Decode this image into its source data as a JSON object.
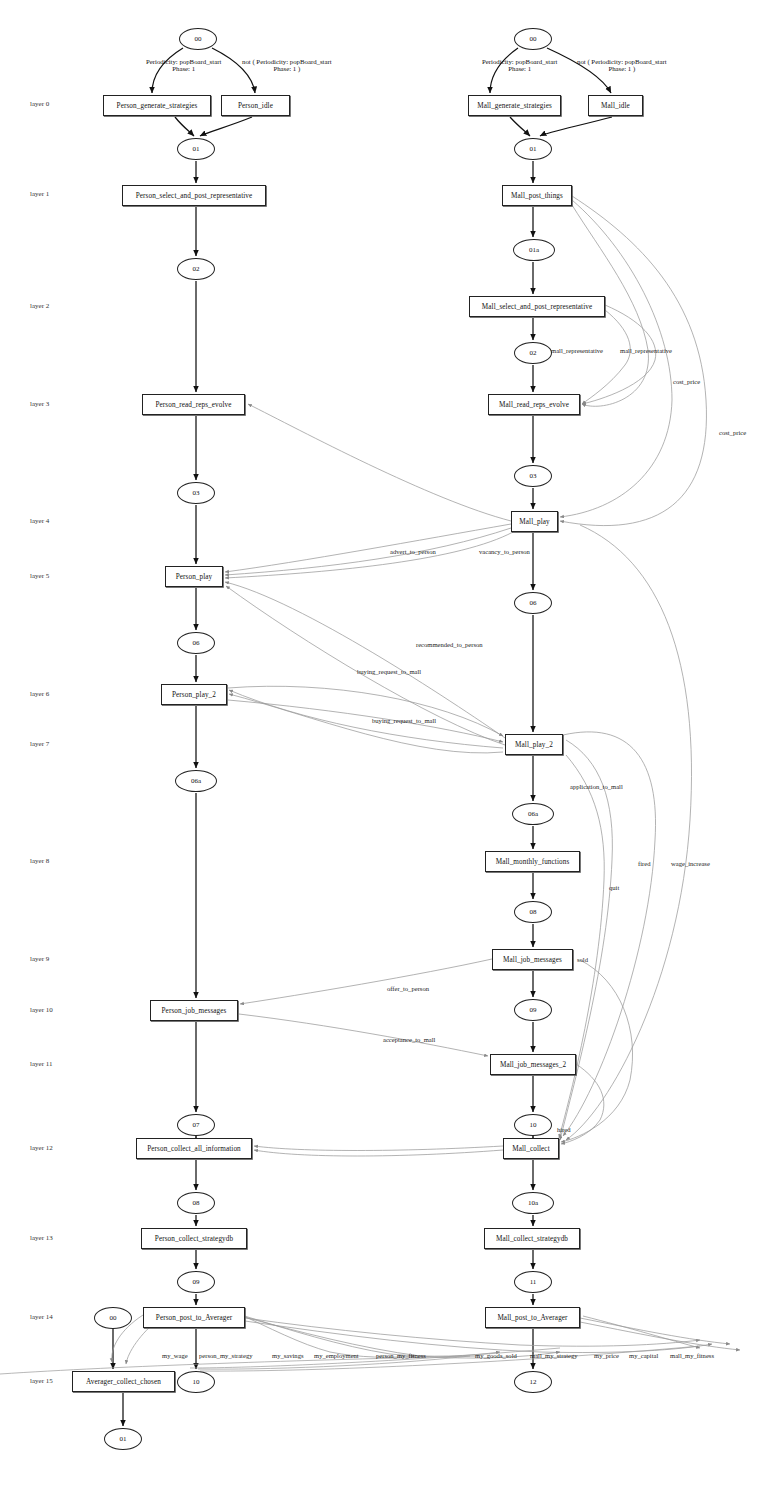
{
  "diagram": {
    "layers": [
      {
        "label": "layer 0",
        "y": 104
      },
      {
        "label": "layer 1",
        "y": 194
      },
      {
        "label": "layer 2",
        "y": 306
      },
      {
        "label": "layer 3",
        "y": 404
      },
      {
        "label": "layer 4",
        "y": 521
      },
      {
        "label": "layer 5",
        "y": 576
      },
      {
        "label": "layer 6",
        "y": 694
      },
      {
        "label": "layer 7",
        "y": 744
      },
      {
        "label": "layer 8",
        "y": 861
      },
      {
        "label": "layer 9",
        "y": 959
      },
      {
        "label": "layer 10",
        "y": 1010
      },
      {
        "label": "layer 11",
        "y": 1064
      },
      {
        "label": "layer 12",
        "y": 1148
      },
      {
        "label": "layer 13",
        "y": 1238
      },
      {
        "label": "layer 14",
        "y": 1317
      },
      {
        "label": "layer 15",
        "y": 1381
      }
    ],
    "boxes": [
      {
        "id": "person_generate_strategies",
        "label": "Person_generate_strategies",
        "x": 103,
        "y": 95,
        "w": 108,
        "h": 21
      },
      {
        "id": "person_idle",
        "label": "Person_idle",
        "x": 221,
        "y": 95,
        "w": 69,
        "h": 21
      },
      {
        "id": "person_select_and_post_representative",
        "label": "Person_select_and_post_representative",
        "x": 122,
        "y": 185,
        "w": 144,
        "h": 21
      },
      {
        "id": "person_read_reps_evolve",
        "label": "Person_read_reps_evolve",
        "x": 142,
        "y": 394,
        "w": 103,
        "h": 21
      },
      {
        "id": "person_play",
        "label": "Person_play",
        "x": 165,
        "y": 566,
        "w": 58,
        "h": 21
      },
      {
        "id": "person_play_2",
        "label": "Person_play_2",
        "x": 161,
        "y": 684,
        "w": 66,
        "h": 21
      },
      {
        "id": "person_job_messages",
        "label": "Person_job_messages",
        "x": 150,
        "y": 1000,
        "w": 88,
        "h": 21
      },
      {
        "id": "person_collect_all_information",
        "label": "Person_collect_all_information",
        "x": 136,
        "y": 1138,
        "w": 116,
        "h": 21
      },
      {
        "id": "person_collect_strategydb",
        "label": "Person_collect_strategydb",
        "x": 141,
        "y": 1228,
        "w": 106,
        "h": 21
      },
      {
        "id": "person_post_to_averager",
        "label": "Person_post_to_Averager",
        "x": 143,
        "y": 1307,
        "w": 102,
        "h": 21
      },
      {
        "id": "averager_collect_chosen",
        "label": "Averager_collect_chosen",
        "x": 72,
        "y": 1371,
        "w": 103,
        "h": 21
      },
      {
        "id": "mall_generate_strategies",
        "label": "Mall_generate_strategies",
        "x": 468,
        "y": 95,
        "w": 93,
        "h": 21
      },
      {
        "id": "mall_idle",
        "label": "Mall_idle",
        "x": 588,
        "y": 95,
        "w": 55,
        "h": 21
      },
      {
        "id": "mall_post_things",
        "label": "Mall_post_things",
        "x": 502,
        "y": 185,
        "w": 70,
        "h": 21
      },
      {
        "id": "mall_select_and_post_representative",
        "label": "Mall_select_and_post_representative",
        "x": 469,
        "y": 296,
        "w": 136,
        "h": 21
      },
      {
        "id": "mall_read_reps_evolve",
        "label": "Mall_read_reps_evolve",
        "x": 488,
        "y": 394,
        "w": 92,
        "h": 21
      },
      {
        "id": "mall_play",
        "label": "Mall_play",
        "x": 511,
        "y": 511,
        "w": 47,
        "h": 21
      },
      {
        "id": "mall_play_2",
        "label": "Mall_play_2",
        "x": 505,
        "y": 734,
        "w": 58,
        "h": 21
      },
      {
        "id": "mall_monthly_functions",
        "label": "Mall_monthly_functions",
        "x": 485,
        "y": 851,
        "w": 95,
        "h": 21
      },
      {
        "id": "mall_job_messages",
        "label": "Mall_job_messages",
        "x": 492,
        "y": 949,
        "w": 81,
        "h": 21
      },
      {
        "id": "mall_job_messages_2",
        "label": "Mall_job_messages_2",
        "x": 490,
        "y": 1054,
        "w": 86,
        "h": 21
      },
      {
        "id": "mall_collect",
        "label": "Mall_collect",
        "x": 503,
        "y": 1138,
        "w": 56,
        "h": 21
      },
      {
        "id": "mall_collect_strategydb",
        "label": "Mall_collect_strategydb",
        "x": 484,
        "y": 1228,
        "w": 96,
        "h": 21
      },
      {
        "id": "mall_post_to_averager",
        "label": "Mall_post_to_Averager",
        "x": 485,
        "y": 1307,
        "w": 95,
        "h": 21
      }
    ],
    "ellipses": [
      {
        "id": "p00",
        "label": "00",
        "x": 179,
        "y": 28,
        "w": 38,
        "h": 22
      },
      {
        "id": "p01",
        "label": "01",
        "x": 177,
        "y": 138,
        "w": 38,
        "h": 22
      },
      {
        "id": "p02",
        "label": "02",
        "x": 177,
        "y": 258,
        "w": 38,
        "h": 22
      },
      {
        "id": "p03",
        "label": "03",
        "x": 177,
        "y": 482,
        "w": 38,
        "h": 22
      },
      {
        "id": "p06",
        "label": "06",
        "x": 177,
        "y": 632,
        "w": 38,
        "h": 22
      },
      {
        "id": "p06a",
        "label": "06a",
        "x": 175,
        "y": 770,
        "w": 42,
        "h": 22
      },
      {
        "id": "p07",
        "label": "07",
        "x": 177,
        "y": 1114,
        "w": 38,
        "h": 22
      },
      {
        "id": "p08",
        "label": "08",
        "x": 177,
        "y": 1192,
        "w": 38,
        "h": 22
      },
      {
        "id": "p09",
        "label": "09",
        "x": 177,
        "y": 1271,
        "w": 38,
        "h": 22
      },
      {
        "id": "av00",
        "label": "00",
        "x": 94,
        "y": 1307,
        "w": 38,
        "h": 22
      },
      {
        "id": "p10",
        "label": "10",
        "x": 177,
        "y": 1371,
        "w": 38,
        "h": 22
      },
      {
        "id": "av01",
        "label": "01",
        "x": 104,
        "y": 1428,
        "w": 38,
        "h": 22
      },
      {
        "id": "m00",
        "label": "00",
        "x": 514,
        "y": 28,
        "w": 38,
        "h": 22
      },
      {
        "id": "m01",
        "label": "01",
        "x": 514,
        "y": 138,
        "w": 38,
        "h": 22
      },
      {
        "id": "m01a",
        "label": "01a",
        "x": 513,
        "y": 239,
        "w": 42,
        "h": 22
      },
      {
        "id": "m02",
        "label": "02",
        "x": 514,
        "y": 342,
        "w": 38,
        "h": 22
      },
      {
        "id": "m03",
        "label": "03",
        "x": 514,
        "y": 465,
        "w": 38,
        "h": 22
      },
      {
        "id": "m06",
        "label": "06",
        "x": 514,
        "y": 592,
        "w": 38,
        "h": 22
      },
      {
        "id": "m06a",
        "label": "06a",
        "x": 512,
        "y": 803,
        "w": 42,
        "h": 22
      },
      {
        "id": "m08",
        "label": "08",
        "x": 514,
        "y": 901,
        "w": 38,
        "h": 22
      },
      {
        "id": "m09",
        "label": "09",
        "x": 514,
        "y": 999,
        "w": 38,
        "h": 22
      },
      {
        "id": "m10",
        "label": "10",
        "x": 514,
        "y": 1114,
        "w": 38,
        "h": 22
      },
      {
        "id": "m10a",
        "label": "10a",
        "x": 512,
        "y": 1192,
        "w": 42,
        "h": 22
      },
      {
        "id": "m11",
        "label": "11",
        "x": 514,
        "y": 1271,
        "w": 38,
        "h": 22
      },
      {
        "id": "m12",
        "label": "12",
        "x": 514,
        "y": 1371,
        "w": 38,
        "h": 22
      }
    ],
    "conditions": [
      {
        "id": "person_cond_left",
        "line1": "Periodicity: popBoard_start",
        "line2": "Phase: 1",
        "x": 146,
        "y": 58
      },
      {
        "id": "person_cond_right",
        "line1": "not ( Periodicity: popBoard_start",
        "line2": "Phase: 1 )",
        "x": 242,
        "y": 58
      },
      {
        "id": "mall_cond_left",
        "line1": "Periodicity: popBoard_start",
        "line2": "Phase: 1",
        "x": 482,
        "y": 58
      },
      {
        "id": "mall_cond_right",
        "line1": "not ( Periodicity: popBoard_start",
        "line2": "Phase: 1 )",
        "x": 577,
        "y": 58
      }
    ],
    "edge_labels": [
      {
        "id": "mall_representative_1",
        "text": "mall_representative",
        "x": 551,
        "y": 347
      },
      {
        "id": "mall_representative_2",
        "text": "mall_representative",
        "x": 620,
        "y": 347
      },
      {
        "id": "cost_price_1",
        "text": "cost_price",
        "x": 673,
        "y": 378
      },
      {
        "id": "cost_price_2",
        "text": "cost_price",
        "x": 719,
        "y": 429
      },
      {
        "id": "advert_to_person",
        "text": "advert_to_person",
        "x": 390,
        "y": 548
      },
      {
        "id": "vacancy_to_person",
        "text": "vacancy_to_person",
        "x": 479,
        "y": 548
      },
      {
        "id": "recommended_to_person",
        "text": "recommended_to_person",
        "x": 416,
        "y": 641
      },
      {
        "id": "buying_request_to_mall_1",
        "text": "buying_request_to_mall",
        "x": 357,
        "y": 668
      },
      {
        "id": "buying_request_to_mall_2",
        "text": "buying_request_to_mall",
        "x": 372,
        "y": 717
      },
      {
        "id": "application_to_mall",
        "text": "application_to_mall",
        "x": 570,
        "y": 783
      },
      {
        "id": "quit",
        "text": "quit",
        "x": 609,
        "y": 884
      },
      {
        "id": "fired_1",
        "text": "fired",
        "x": 638,
        "y": 860
      },
      {
        "id": "wage_increase",
        "text": "wage_increase",
        "x": 671,
        "y": 860
      },
      {
        "id": "sold",
        "text": "sold",
        "x": 577,
        "y": 956
      },
      {
        "id": "offer_to_person",
        "text": "offer_to_person",
        "x": 387,
        "y": 985
      },
      {
        "id": "acceptance_to_mall",
        "text": "acceptance_to_mall",
        "x": 383,
        "y": 1036
      },
      {
        "id": "hired",
        "text": "hired",
        "x": 557,
        "y": 1126
      },
      {
        "id": "my_wage",
        "text": "my_wage",
        "x": 162,
        "y": 1352
      },
      {
        "id": "person_my_strategy",
        "text": "person_my_strategy",
        "x": 199,
        "y": 1352
      },
      {
        "id": "my_savings",
        "text": "my_savings",
        "x": 272,
        "y": 1352
      },
      {
        "id": "my_employment",
        "text": "my_employment",
        "x": 314,
        "y": 1352
      },
      {
        "id": "person_my_fitness",
        "text": "person_my_fitness",
        "x": 376,
        "y": 1352
      },
      {
        "id": "my_goods_sold",
        "text": "my_goods_sold",
        "x": 475,
        "y": 1352
      },
      {
        "id": "mall_my_strategy",
        "text": "mall_my_strategy",
        "x": 530,
        "y": 1352
      },
      {
        "id": "my_price",
        "text": "my_price",
        "x": 594,
        "y": 1352
      },
      {
        "id": "my_capital",
        "text": "my_capital",
        "x": 629,
        "y": 1352
      },
      {
        "id": "mall_my_fitness",
        "text": "mall_my_fitness",
        "x": 670,
        "y": 1352
      }
    ]
  }
}
